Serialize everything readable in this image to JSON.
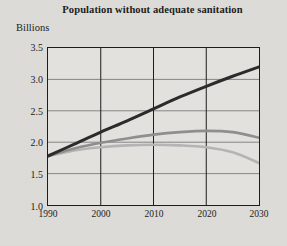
{
  "chart_data": {
    "type": "line",
    "title": "Population without adequate sanitation",
    "ylabel": "Billions",
    "xlabel": "",
    "xlim": [
      1990,
      2030
    ],
    "ylim": [
      1.0,
      3.5
    ],
    "grid": true,
    "legend": "none",
    "xticks": [
      "1990",
      "2000",
      "2010",
      "2020",
      "2030"
    ],
    "xtick_values": [
      1990,
      2000,
      2010,
      2020,
      2030
    ],
    "yticks": [
      "1.0",
      "1.5",
      "2.0",
      "2.5",
      "3.0",
      "3.5"
    ],
    "ytick_values": [
      1.0,
      1.5,
      2.0,
      2.5,
      3.0,
      3.5
    ],
    "x": [
      1990,
      1995,
      2000,
      2005,
      2010,
      2015,
      2020,
      2025,
      2030
    ],
    "series": [
      {
        "name": "no-action scenario",
        "color": "#2b2b2b",
        "width": 3.0,
        "values": [
          1.78,
          1.97,
          2.16,
          2.34,
          2.53,
          2.72,
          2.89,
          3.05,
          3.2
        ]
      },
      {
        "name": "middle scenario",
        "color": "#8e8e8e",
        "width": 2.6,
        "values": [
          1.78,
          1.9,
          1.99,
          2.06,
          2.12,
          2.16,
          2.18,
          2.16,
          2.07
        ]
      },
      {
        "name": "accelerated-coverage scenario",
        "color": "#b4b4b4",
        "width": 2.6,
        "values": [
          1.78,
          1.87,
          1.92,
          1.95,
          1.96,
          1.95,
          1.92,
          1.84,
          1.67
        ]
      }
    ]
  }
}
